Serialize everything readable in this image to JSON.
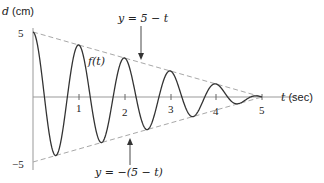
{
  "chart_data": {
    "type": "line",
    "title": "",
    "xlabel": "t (sec)",
    "ylabel": "d (cm)",
    "xlim": [
      0,
      5
    ],
    "ylim": [
      -5,
      5
    ],
    "x_ticks": [
      "1",
      "2",
      "3",
      "4",
      "5"
    ],
    "y_ticks": [
      "5",
      "−5"
    ],
    "grid": false,
    "legend": null,
    "series": [
      {
        "name": "f(t)",
        "style": "solid",
        "formula": "(5 - t) cos(2πt)",
        "x": [
          0,
          0.5,
          1,
          1.5,
          2,
          2.5,
          3,
          3.5,
          4,
          4.5,
          5
        ],
        "values": [
          5,
          -4.5,
          4,
          -3.5,
          3,
          -2.5,
          2,
          -1.5,
          1,
          -0.5,
          0
        ]
      },
      {
        "name": "y = 5 − t",
        "style": "dashed",
        "x": [
          0,
          5
        ],
        "values": [
          5,
          0
        ]
      },
      {
        "name": "y = −(5 − t)",
        "style": "dashed",
        "x": [
          0,
          5
        ],
        "values": [
          -5,
          0
        ]
      }
    ],
    "annotations": [
      {
        "text": "y = 5 − t",
        "points_to": "upper envelope near t = 2"
      },
      {
        "text": "y = −(5 − t)",
        "points_to": "lower envelope near t = 2"
      },
      {
        "text": "f(t)",
        "near": "curve near t = 1"
      }
    ]
  },
  "labels": {
    "y_axis_var": "d",
    "y_axis_unit": "(cm)",
    "x_axis_var": "t",
    "x_axis_unit": "(sec)",
    "y_top": "5",
    "y_bottom": "−5",
    "x1": "1",
    "x2": "2",
    "x3": "3",
    "x4": "4",
    "x5": "5",
    "curve_label": "f(t)",
    "upper_label": "y = 5 − t",
    "lower_label": "y = −(5 − t)"
  },
  "colors": {
    "curve": "#333333",
    "envelope": "#a8a8a8",
    "axis": "#999999",
    "text": "#222222"
  }
}
